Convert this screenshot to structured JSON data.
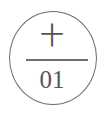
{
  "badge": {
    "top_text": "十",
    "number": "01",
    "stroke_color": "#6e6e6e",
    "text_color": "#555555"
  }
}
